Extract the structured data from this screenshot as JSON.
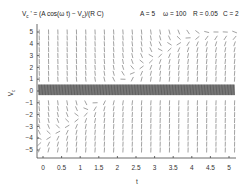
{
  "chart_data": {
    "type": "slope_field",
    "title_parts": {
      "lhs_main": "V",
      "lhs_sub": "c",
      "lhs_rest": " ' = (A cos(ω t) − V",
      "rhs_sub": "c",
      "rhs_rest": ")/(R C)"
    },
    "parameters": {
      "A": 5,
      "omega": 100,
      "R": 0.05,
      "C": 2
    },
    "parameter_labels": [
      "A = 5",
      "ω = 100",
      "R = 0.05",
      "C = 2"
    ],
    "xlabel": "t",
    "ylabel_main": "V",
    "ylabel_sub": "c",
    "xlim": [
      -0.25,
      5.2
    ],
    "ylim": [
      -5.6,
      5.6
    ],
    "x_ticks": [
      0,
      0.5,
      1,
      1.5,
      2,
      2.5,
      3,
      3.5,
      4,
      4.5,
      5
    ],
    "x_tick_labels": [
      "0",
      "0.5",
      "1",
      "1.5",
      "2",
      "2.5",
      "3",
      "3.5",
      "4",
      "4.5",
      "5"
    ],
    "y_ticks": [
      5,
      4,
      3,
      2,
      1,
      0,
      -1,
      -2,
      -3,
      -4,
      -5
    ],
    "y_tick_labels": [
      "5",
      "4",
      "3",
      "2",
      "1",
      "0",
      "−1",
      "−2",
      "−3",
      "−4",
      "−5"
    ],
    "grid": false,
    "field": {
      "t_start": -0.1,
      "t_step": 0.25,
      "t_count": 22,
      "v_start": -5,
      "v_step": 0.5,
      "v_count": 21,
      "dense_band": {
        "v_min": -0.35,
        "v_max": 0.55,
        "t_step": 0.02
      }
    },
    "colors": {
      "segments": "#555555",
      "dense_band": "#111111",
      "axis": "#444444"
    }
  }
}
